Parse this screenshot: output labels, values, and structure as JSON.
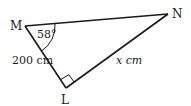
{
  "diagram": {
    "vertices": {
      "M": {
        "label": "M"
      },
      "N": {
        "label": "N"
      },
      "L": {
        "label": "L"
      }
    },
    "angle_M": "58°",
    "side_ML": "200 cm",
    "side_LN": "x cm",
    "right_angle_at": "L",
    "stroke_color": "#1a1a1a"
  }
}
